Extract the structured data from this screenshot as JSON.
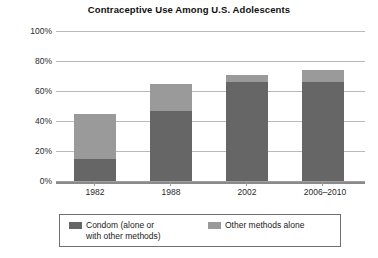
{
  "chart_data": {
    "type": "bar",
    "title": "Contraceptive Use Among U.S. Adolescents",
    "xlabel": "",
    "ylabel": "",
    "ylim": [
      0,
      100
    ],
    "stacked": true,
    "grid": true,
    "legend_position": "bottom",
    "categories": [
      "1982",
      "1988",
      "2002",
      "2006–2010"
    ],
    "ytick_labels": [
      "100%",
      "80%",
      "60%",
      "40%",
      "20%",
      "0%"
    ],
    "ytick_values": [
      100,
      80,
      60,
      40,
      20,
      0
    ],
    "series": [
      {
        "name": "Condom (alone or\nwith other methods)",
        "color": "#666666",
        "values": [
          15,
          47,
          66,
          66
        ]
      },
      {
        "name": "Other methods alone",
        "color": "#9a9a9a",
        "values": [
          30,
          18,
          5,
          8
        ]
      }
    ],
    "totals": [
      45,
      65,
      71,
      74
    ]
  },
  "legend": {
    "entries": [
      {
        "label": "Condom (alone or\nwith other methods)",
        "color": "#666666"
      },
      {
        "label": "Other methods alone",
        "color": "#9a9a9a"
      }
    ]
  },
  "colors": {
    "condom": "#666666",
    "other": "#9a9a9a",
    "gridline": "#b9b9b9",
    "axis": "#8a8a8a",
    "background": "#ffffff",
    "text": "#1a1a1a"
  }
}
